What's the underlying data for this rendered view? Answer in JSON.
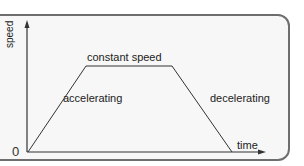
{
  "diagram": {
    "title": "",
    "axes": {
      "x_label": "time",
      "y_label": "speed",
      "origin_label": "0"
    },
    "segments": [
      {
        "label": "accelerating",
        "shape": "rising line"
      },
      {
        "label": "constant speed",
        "shape": "horizontal line"
      },
      {
        "label": "decelerating",
        "shape": "falling line"
      }
    ],
    "colors": {
      "line": "#333333",
      "frame_border": "#6e6e6e",
      "background": "#f7f7f7"
    }
  }
}
